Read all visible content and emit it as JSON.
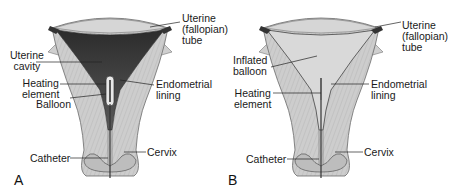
{
  "figure": {
    "panel_a": {
      "letter": "A",
      "labels": {
        "fallopian_tube": "Uterine\n(fallopian)\ntube",
        "uterine_cavity": "Uterine\ncavity",
        "heating_element": "Heating\nelement",
        "balloon": "Balloon",
        "endometrial_lining": "Endometrial\nlining",
        "catheter": "Catheter",
        "cervix": "Cervix"
      }
    },
    "panel_b": {
      "letter": "B",
      "labels": {
        "fallopian_tube": "Uterine\n(fallopian)\ntube",
        "inflated_balloon": "Inflated\nballoon",
        "heating_element": "Heating\nelement",
        "endometrial_lining": "Endometrial\nlining",
        "catheter": "Catheter",
        "cervix": "Cervix"
      }
    },
    "colors": {
      "muscle": "#c9c9c9",
      "muscle_stripe": "#b3b3b3",
      "cavity_dark": "#3a3a3a",
      "balloon_light": "#dcdcdc",
      "outline": "#555555",
      "leader": "#222222"
    }
  }
}
